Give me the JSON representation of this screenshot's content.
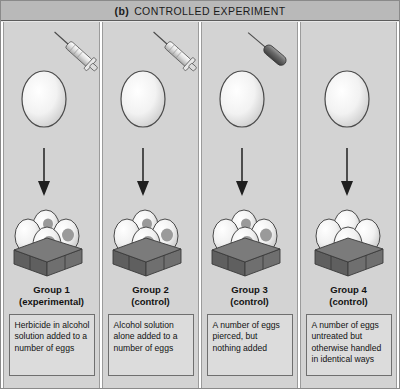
{
  "header": {
    "label": "(b)",
    "title": "CONTROLLED EXPERIMENT"
  },
  "colors": {
    "figure_border": "#8a8a8a",
    "header_background": "#b9b9b9",
    "panel_background": "#d3d3d3",
    "description_background": "#dcdcdc",
    "description_border": "#6f6f6f",
    "egg_fill": "#f4f4f4",
    "egg_outline": "#4a4a4a",
    "egg_spot": "#9a9a9a",
    "carton_dark": "#5f5f5f",
    "carton_mid": "#767676",
    "arrow_color": "#2b2b2b",
    "text_color": "#121212"
  },
  "panels": [
    {
      "group_name": "Group 1",
      "group_type": "(experimental)",
      "description": "Herbicide in alcohol solution added to a number of eggs",
      "instrument": "syringe",
      "eggs_spotted": true
    },
    {
      "group_name": "Group 2",
      "group_type": "(control)",
      "description": "Alcohol solution alone added to a number of eggs",
      "instrument": "syringe",
      "eggs_spotted": true
    },
    {
      "group_name": "Group 3",
      "group_type": "(control)",
      "description": "A number of eggs pierced, but nothing added",
      "instrument": "piercing-needle",
      "eggs_spotted": true
    },
    {
      "group_name": "Group 4",
      "group_type": "(control)",
      "description": "A number of eggs untreated but otherwise handled in identical ways",
      "instrument": "none",
      "eggs_spotted": false
    }
  ]
}
